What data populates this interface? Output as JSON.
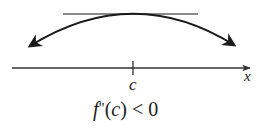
{
  "diagram": {
    "axis_label": "x",
    "point_label": "c",
    "condition": {
      "f": "f",
      "primes": "\"",
      "open": "(",
      "c": "c",
      "close": ")",
      "rest": " < 0"
    },
    "colors": {
      "curve": "#1a1a1a",
      "tangent": "#8a8a8a",
      "axis": "#333333"
    }
  }
}
